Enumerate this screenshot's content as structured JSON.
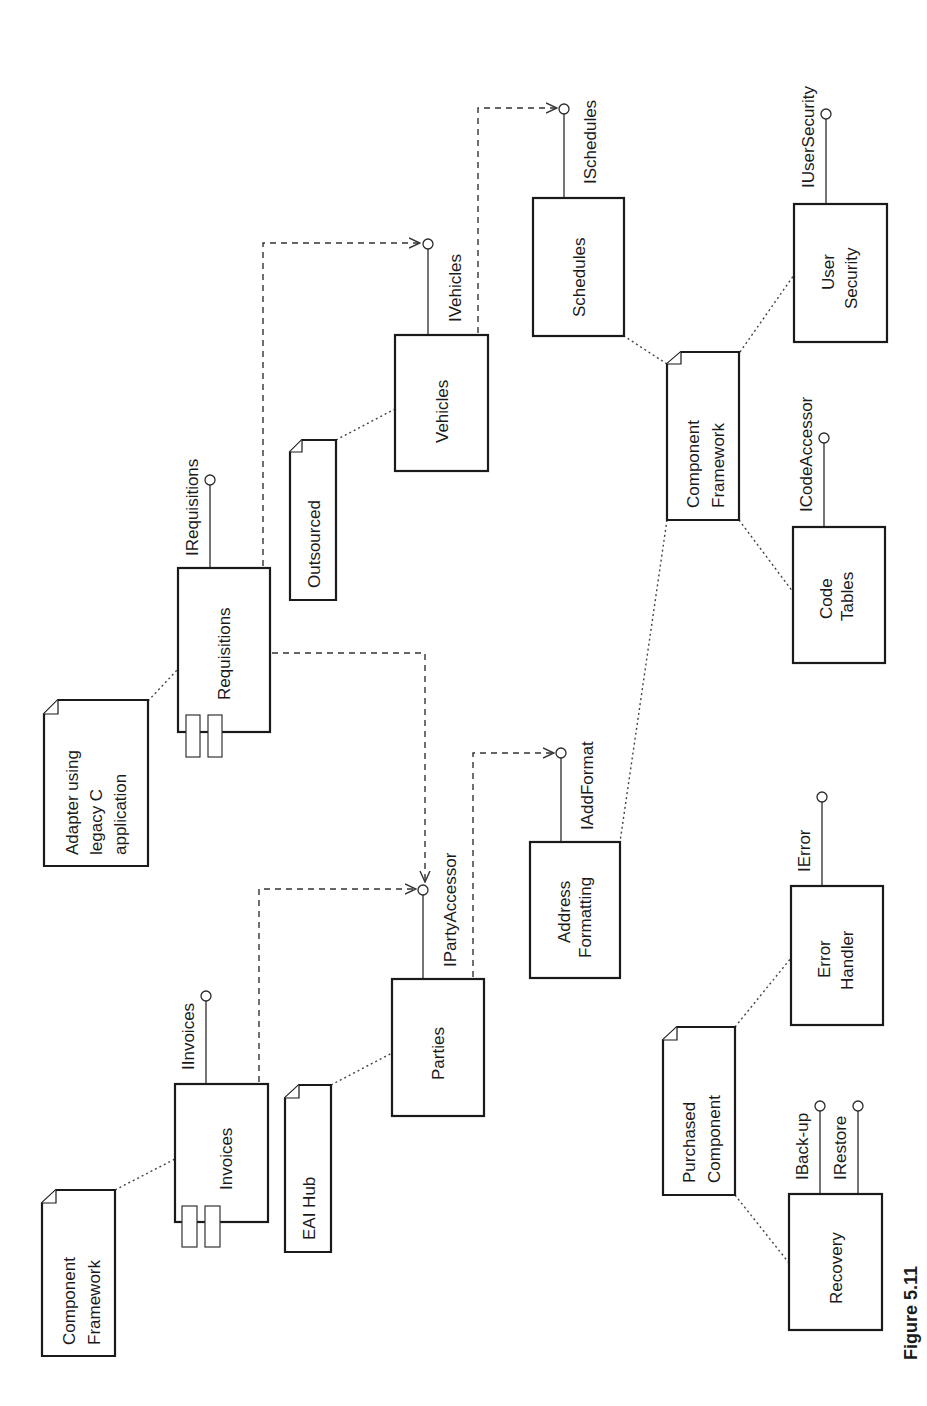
{
  "figure": {
    "caption": "Figure 5.11",
    "orientation": "rotated -90deg (text reads bottom-to-top)"
  },
  "components": [
    {
      "id": "requisitions",
      "label": [
        "Requisitions"
      ],
      "has_component_tabs": true
    },
    {
      "id": "invoices",
      "label": [
        "Invoices"
      ],
      "has_component_tabs": true
    },
    {
      "id": "vehicles",
      "label": [
        "Vehicles"
      ],
      "has_component_tabs": false
    },
    {
      "id": "parties",
      "label": [
        "Parties"
      ],
      "has_component_tabs": false
    },
    {
      "id": "schedules",
      "label": [
        "Schedules"
      ],
      "has_component_tabs": false
    },
    {
      "id": "address-formatting",
      "label": [
        "Address",
        "Formatting"
      ],
      "has_component_tabs": false
    },
    {
      "id": "user-security",
      "label": [
        "User",
        "Security"
      ],
      "has_component_tabs": false
    },
    {
      "id": "code-tables",
      "label": [
        "Code",
        "Tables"
      ],
      "has_component_tabs": false
    },
    {
      "id": "error-handler",
      "label": [
        "Error",
        "Handler"
      ],
      "has_component_tabs": false
    },
    {
      "id": "recovery",
      "label": [
        "Recovery"
      ],
      "has_component_tabs": false
    }
  ],
  "notes": [
    {
      "id": "note-adapter",
      "label": [
        "Adapter using",
        "legacy C",
        "application"
      ],
      "attached_to": "requisitions"
    },
    {
      "id": "note-outsourced",
      "label": [
        "Outsourced"
      ],
      "attached_to": "vehicles"
    },
    {
      "id": "note-component-framework-left",
      "label": [
        "Component",
        "Framework"
      ],
      "attached_to": "invoices"
    },
    {
      "id": "note-eai-hub",
      "label": [
        "EAI Hub"
      ],
      "attached_to": "parties"
    },
    {
      "id": "note-component-framework-right",
      "label": [
        "Component",
        "Framework"
      ],
      "attached_to": [
        "schedules",
        "user-security",
        "code-tables",
        "address-formatting"
      ]
    },
    {
      "id": "note-purchased-component",
      "label": [
        "Purchased",
        "Component"
      ],
      "attached_to": [
        "error-handler",
        "recovery"
      ]
    }
  ],
  "interfaces": [
    {
      "name": "IRequisitions",
      "provided_by": "requisitions"
    },
    {
      "name": "IInvoices",
      "provided_by": "invoices"
    },
    {
      "name": "IVehicles",
      "provided_by": "vehicles"
    },
    {
      "name": "IPartyAccessor",
      "provided_by": "parties"
    },
    {
      "name": "ISchedules",
      "provided_by": "schedules"
    },
    {
      "name": "IAddFormat",
      "provided_by": "address-formatting"
    },
    {
      "name": "IUserSecurity",
      "provided_by": "user-security"
    },
    {
      "name": "ICodeAccessor",
      "provided_by": "code-tables"
    },
    {
      "name": "IError",
      "provided_by": "error-handler"
    },
    {
      "name": "IBack-up",
      "provided_by": "recovery"
    },
    {
      "name": "IRestore",
      "provided_by": "recovery"
    }
  ],
  "dependencies": [
    {
      "from": "requisitions",
      "to": "IVehicles"
    },
    {
      "from": "requisitions",
      "to": "IPartyAccessor"
    },
    {
      "from": "invoices",
      "to": "IPartyAccessor"
    },
    {
      "from": "vehicles",
      "to": "ISchedules"
    },
    {
      "from": "parties",
      "to": "IAddFormat"
    }
  ],
  "labels": {
    "requisitions": "Requisitions",
    "invoices": "Invoices",
    "vehicles": "Vehicles",
    "parties": "Parties",
    "schedules": "Schedules",
    "address_1": "Address",
    "address_2": "Formatting",
    "usersec_1": "User",
    "usersec_2": "Security",
    "codetables_1": "Code",
    "codetables_2": "Tables",
    "error_1": "Error",
    "error_2": "Handler",
    "recovery": "Recovery",
    "adapter_1": "Adapter using",
    "adapter_2": "legacy C",
    "adapter_3": "application",
    "outsourced": "Outsourced",
    "cf_left_1": "Component",
    "cf_left_2": "Framework",
    "eai": "EAI Hub",
    "cf_right_1": "Component",
    "cf_right_2": "Framework",
    "purchased_1": "Purchased",
    "purchased_2": "Component",
    "i_requisitions": "IRequisitions",
    "i_invoices": "IInvoices",
    "i_vehicles": "IVehicles",
    "i_party": "IPartyAccessor",
    "i_schedules": "ISchedules",
    "i_addformat": "IAddFormat",
    "i_usersecurity": "IUserSecurity",
    "i_codeaccessor": "ICodeAccessor",
    "i_error": "IError",
    "i_backup": "IBack-up",
    "i_restore": "IRestore",
    "figure": "Figure 5.11"
  }
}
